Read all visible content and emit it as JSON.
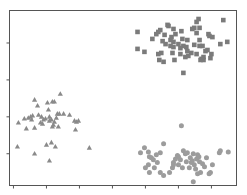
{
  "chart_data": {
    "type": "scatter",
    "title": "",
    "xlabel": "",
    "ylabel": "",
    "legend": null,
    "grid": false,
    "xlim": [
      -0.12,
      6.76
    ],
    "ylim": [
      0.14,
      4.88
    ],
    "xticks": [
      0,
      1,
      2,
      3,
      4,
      5,
      6
    ],
    "yticks": [
      1,
      2,
      3,
      4
    ],
    "xtick_labels": [],
    "ytick_labels": [],
    "colors": {
      "squares": "#7b7b7b",
      "triangles": "#8a8a8a",
      "circles": "#9c9c9c",
      "spine": "#555555"
    },
    "series": [
      {
        "name": "cluster-squares",
        "marker": "square",
        "points": [
          [
            3.76,
            3.84
          ],
          [
            3.76,
            4.3
          ],
          [
            3.97,
            3.76
          ],
          [
            4.33,
            4.24
          ],
          [
            4.45,
            4.35
          ],
          [
            4.52,
            4.05
          ],
          [
            4.58,
            4.22
          ],
          [
            4.7,
            4.46
          ],
          [
            4.39,
            4.3
          ],
          [
            4.61,
            3.97
          ],
          [
            4.76,
            3.92
          ],
          [
            4.79,
            4.16
          ],
          [
            4.82,
            3.73
          ],
          [
            4.85,
            3.89
          ],
          [
            4.88,
            3.54
          ],
          [
            4.85,
            4.03
          ],
          [
            4.91,
            4.24
          ],
          [
            5.09,
            4.32
          ],
          [
            5.12,
            4.11
          ],
          [
            5.15,
            3.92
          ],
          [
            5.06,
            3.86
          ],
          [
            5.06,
            3.7
          ],
          [
            5.24,
            3.89
          ],
          [
            5.21,
            3.62
          ],
          [
            5.27,
            3.78
          ],
          [
            5.42,
            4.38
          ],
          [
            5.48,
            3.95
          ],
          [
            5.55,
            4.27
          ],
          [
            5.64,
            4.41
          ],
          [
            5.55,
            4.57
          ],
          [
            5.61,
            4.65
          ],
          [
            5.64,
            4.08
          ],
          [
            5.73,
            3.92
          ],
          [
            5.7,
            3.57
          ],
          [
            5.67,
            3.54
          ],
          [
            5.55,
            3.7
          ],
          [
            5.76,
            3.62
          ],
          [
            5.48,
            4.41
          ],
          [
            5.82,
            3.78
          ],
          [
            5.88,
            3.81
          ],
          [
            5.91,
            4.24
          ],
          [
            5.94,
            4.19
          ],
          [
            6.0,
            3.7
          ],
          [
            6.03,
            4.16
          ],
          [
            6.27,
            3.97
          ],
          [
            6.36,
            4.62
          ],
          [
            6.48,
            4.03
          ],
          [
            5.76,
            3.54
          ],
          [
            5.3,
            3.65
          ],
          [
            4.85,
            4.38
          ],
          [
            4.67,
            4.49
          ],
          [
            4.76,
            4.08
          ],
          [
            5.39,
            3.73
          ],
          [
            5.27,
            4.08
          ],
          [
            4.21,
            4.11
          ],
          [
            4.48,
            3.73
          ],
          [
            4.39,
            3.7
          ],
          [
            5.15,
            3.19
          ],
          [
            4.42,
            3.54
          ],
          [
            4.55,
            3.49
          ],
          [
            5.64,
            3.92
          ],
          [
            5.97,
            3.59
          ],
          [
            5.0,
            3.97
          ]
        ]
      },
      {
        "name": "cluster-triangles",
        "marker": "triangle",
        "points": [
          [
            0.15,
            1.84
          ],
          [
            0.33,
            1.95
          ],
          [
            0.45,
            1.97
          ],
          [
            0.52,
            2.0
          ],
          [
            0.58,
            2.03
          ],
          [
            0.76,
            2.05
          ],
          [
            0.85,
            2.0
          ],
          [
            0.91,
            1.92
          ],
          [
            0.97,
            1.95
          ],
          [
            1.09,
            1.89
          ],
          [
            1.15,
            1.92
          ],
          [
            1.24,
            1.86
          ],
          [
            1.3,
            1.97
          ],
          [
            1.39,
            2.08
          ],
          [
            1.52,
            2.08
          ],
          [
            1.7,
            2.05
          ],
          [
            1.85,
            1.89
          ],
          [
            1.91,
            1.86
          ],
          [
            1.97,
            1.89
          ],
          [
            0.64,
            2.46
          ],
          [
            0.73,
            2.3
          ],
          [
            1.03,
            2.38
          ],
          [
            1.18,
            2.41
          ],
          [
            1.24,
            2.41
          ],
          [
            1.42,
            2.62
          ],
          [
            1.06,
            2.19
          ],
          [
            1.33,
            2.08
          ],
          [
            0.39,
            1.68
          ],
          [
            0.64,
            1.7
          ],
          [
            1.36,
            1.73
          ],
          [
            1.88,
            1.65
          ],
          [
            0.12,
            1.19
          ],
          [
            0.64,
            1.0
          ],
          [
            1.0,
            1.24
          ],
          [
            1.15,
            1.3
          ],
          [
            1.27,
            1.19
          ],
          [
            1.09,
            0.81
          ],
          [
            2.3,
            1.16
          ],
          [
            1.21,
            1.78
          ],
          [
            0.88,
            1.81
          ],
          [
            1.09,
            2.0
          ],
          [
            0.82,
            1.84
          ],
          [
            1.18,
            1.73
          ],
          [
            0.55,
            1.92
          ]
        ]
      },
      {
        "name": "cluster-circles",
        "marker": "circle",
        "points": [
          [
            3.85,
            1.03
          ],
          [
            3.97,
            1.16
          ],
          [
            4.09,
            1.05
          ],
          [
            4.18,
            0.89
          ],
          [
            4.24,
            0.84
          ],
          [
            4.09,
            0.7
          ],
          [
            4.27,
            0.62
          ],
          [
            4.0,
            0.62
          ],
          [
            4.12,
            0.49
          ],
          [
            4.45,
            0.49
          ],
          [
            4.55,
            0.41
          ],
          [
            4.36,
            0.76
          ],
          [
            4.45,
            1.03
          ],
          [
            4.55,
            1.27
          ],
          [
            4.85,
            0.76
          ],
          [
            4.91,
            0.86
          ],
          [
            4.82,
            0.62
          ],
          [
            4.73,
            0.49
          ],
          [
            5.0,
            0.92
          ],
          [
            5.06,
            0.84
          ],
          [
            5.12,
            0.62
          ],
          [
            5.0,
            0.7
          ],
          [
            5.15,
            1.08
          ],
          [
            5.24,
            0.78
          ],
          [
            5.33,
            0.62
          ],
          [
            5.36,
            0.89
          ],
          [
            5.39,
            0.76
          ],
          [
            5.42,
            0.81
          ],
          [
            5.45,
            1.0
          ],
          [
            5.55,
            0.86
          ],
          [
            5.58,
            0.97
          ],
          [
            5.48,
            0.7
          ],
          [
            5.52,
            0.59
          ],
          [
            5.58,
            0.46
          ],
          [
            5.64,
            0.78
          ],
          [
            5.73,
            0.73
          ],
          [
            5.79,
            0.65
          ],
          [
            5.67,
            0.49
          ],
          [
            5.85,
            0.89
          ],
          [
            5.97,
            0.49
          ],
          [
            6.03,
            0.7
          ],
          [
            6.24,
            1.03
          ],
          [
            6.27,
            1.08
          ],
          [
            6.51,
            1.05
          ],
          [
            5.09,
            1.76
          ],
          [
            5.45,
            0.24
          ],
          [
            4.85,
            0.7
          ],
          [
            4.97,
            0.95
          ],
          [
            5.27,
            1.03
          ],
          [
            4.33,
            0.97
          ],
          [
            4.12,
            0.92
          ],
          [
            5.21,
            1.0
          ],
          [
            5.62,
            0.92
          ],
          [
            5.93,
            0.46
          ]
        ]
      }
    ]
  }
}
